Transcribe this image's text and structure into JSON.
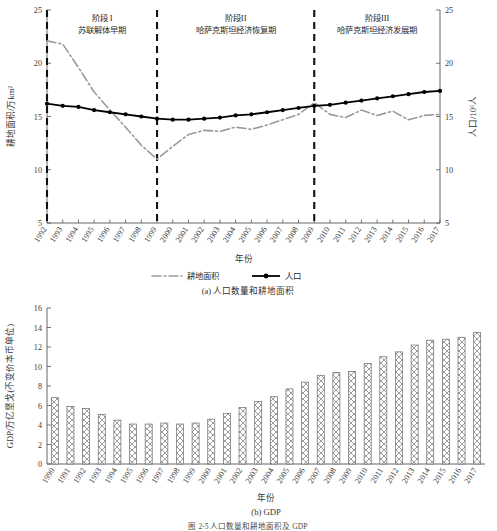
{
  "figure": {
    "title_partial": "图 2-5  人口数量和耕地面积及 GDP",
    "panel_a_caption": "(a) 人口数量和耕地面积",
    "panel_b_caption": "(b) GDP"
  },
  "panel_a": {
    "y_left_label": "耕地面积/万km²",
    "y_right_label": "人口/10⁶人",
    "x_label": "年份",
    "y_ticks": [
      5,
      10,
      15,
      20,
      25
    ],
    "y_right_ticks": [
      5,
      10,
      15,
      20,
      25
    ],
    "stages": [
      {
        "name": "阶段 I",
        "desc": "苏联解体早期",
        "start_year": 1992,
        "end_year": 1999
      },
      {
        "name": "阶段II",
        "desc": "哈萨克斯坦经济恢复期",
        "start_year": 1999,
        "end_year": 2009
      },
      {
        "name": "阶段III",
        "desc": "哈萨克斯坦经济发展期",
        "start_year": 2009,
        "end_year": 2017
      }
    ],
    "divider_years": [
      1992,
      1999,
      2009
    ],
    "legend": [
      {
        "label": "耕地面积",
        "style": "dashdot-gray"
      },
      {
        "label": "人口",
        "style": "solid-black-marker"
      }
    ]
  },
  "panel_b": {
    "y_label": "GDP/万亿坚戈(不变价本币单位)",
    "x_label": "年份",
    "y_ticks": [
      0,
      2,
      4,
      6,
      8,
      10,
      12,
      14,
      16
    ]
  },
  "chart_data": [
    {
      "type": "line",
      "id": "panel-a",
      "title": "(a) 人口数量和耕地面积",
      "xlabel": "年份",
      "ylabel": "耕地面积/万km²",
      "y2label": "人口/10⁶人",
      "ylim": [
        5,
        25
      ],
      "y2lim": [
        5,
        25
      ],
      "grid": false,
      "legend_position": "bottom",
      "x": [
        1992,
        1993,
        1994,
        1995,
        1996,
        1997,
        1998,
        1999,
        2000,
        2001,
        2002,
        2003,
        2004,
        2005,
        2006,
        2007,
        2008,
        2009,
        2010,
        2011,
        2012,
        2013,
        2014,
        2015,
        2016,
        2017
      ],
      "series": [
        {
          "name": "耕地面积",
          "axis": "left",
          "unit": "万km²",
          "values": [
            22.1,
            21.8,
            19.6,
            17.3,
            15.6,
            14.0,
            12.3,
            11.0,
            12.2,
            13.3,
            13.7,
            13.6,
            14.0,
            13.8,
            14.2,
            14.7,
            15.2,
            16.3,
            15.2,
            14.9,
            15.6,
            15.1,
            15.5,
            14.7,
            15.1,
            15.2
          ]
        },
        {
          "name": "人口",
          "axis": "right",
          "unit": "10⁶人",
          "values": [
            16.2,
            16.0,
            15.9,
            15.6,
            15.4,
            15.2,
            15.0,
            14.8,
            14.7,
            14.7,
            14.8,
            14.9,
            15.1,
            15.2,
            15.4,
            15.6,
            15.8,
            16.0,
            16.1,
            16.3,
            16.5,
            16.7,
            16.9,
            17.1,
            17.3,
            17.4
          ]
        }
      ]
    },
    {
      "type": "bar",
      "id": "panel-b",
      "title": "(b) GDP",
      "xlabel": "年份",
      "ylabel": "GDP/万亿坚戈(不变价本币单位)",
      "ylim": [
        0,
        16
      ],
      "grid": false,
      "categories": [
        "1990",
        "1991",
        "1992",
        "1993",
        "1994",
        "1995",
        "1996",
        "1997",
        "1998",
        "1999",
        "2000",
        "2001",
        "2002",
        "2003",
        "2004",
        "2005",
        "2006",
        "2007",
        "2008",
        "2009",
        "2010",
        "2011",
        "2012",
        "2013",
        "2014",
        "2015",
        "2016",
        "2017"
      ],
      "values": [
        6.8,
        5.9,
        5.7,
        5.1,
        4.5,
        4.1,
        4.1,
        4.2,
        4.1,
        4.2,
        4.6,
        5.2,
        5.8,
        6.4,
        6.9,
        7.7,
        8.4,
        9.1,
        9.4,
        9.5,
        10.3,
        11.0,
        11.5,
        12.2,
        12.7,
        12.8,
        13.0,
        13.5
      ]
    }
  ]
}
